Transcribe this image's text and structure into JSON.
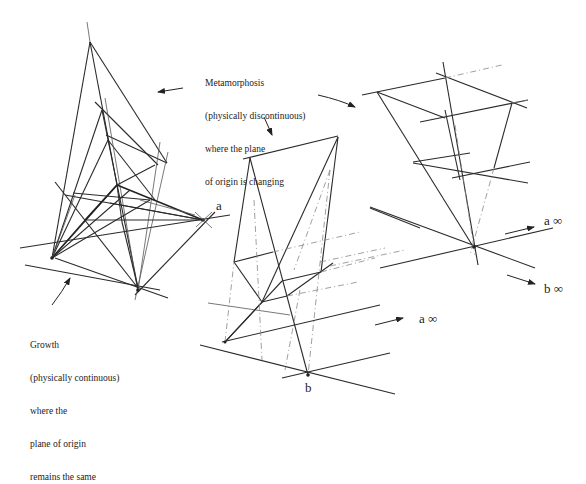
{
  "annotations": {
    "metamorphosis": {
      "lines": [
        "Metamorphosis",
        "(physically discontinuous)",
        "where the plane",
        "of origin is changing"
      ]
    },
    "growth": {
      "lines": [
        "Growth",
        "(physically continuous)",
        "where the",
        "plane of origin",
        "remains the same"
      ]
    }
  },
  "point_labels": {
    "a": "a",
    "b": "b",
    "a_inf_center": "a ∞",
    "a_inf_right": "a ∞",
    "b_inf_right": "b ∞"
  },
  "figures": [
    "growth-figure",
    "metamorphosis-figure-middle",
    "metamorphosis-figure-right"
  ]
}
